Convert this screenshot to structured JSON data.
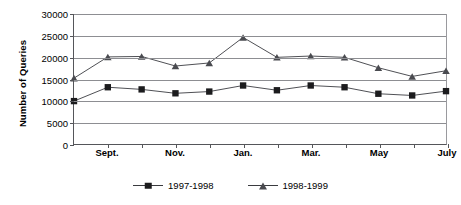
{
  "chart_data": {
    "type": "line",
    "title": "",
    "xlabel": "",
    "ylabel": "Number of Queries",
    "ylim": [
      0,
      30000
    ],
    "ytick_values": [
      0,
      5000,
      10000,
      15000,
      20000,
      25000,
      30000
    ],
    "ytick_labels": [
      "0",
      "5000",
      "10000",
      "15000",
      "20000",
      "25000",
      "30000"
    ],
    "grid": true,
    "legend_position": "bottom-center",
    "x": [
      "Aug.",
      "Sept.",
      "Oct.",
      "Nov.",
      "Dec.",
      "Jan.",
      "Feb.",
      "Mar.",
      "Apr.",
      "May",
      "June",
      "July"
    ],
    "xtick_labels_shown": [
      "Sept.",
      "Nov.",
      "Jan.",
      "Mar.",
      "May",
      "July"
    ],
    "xtick_label_indices": [
      1,
      3,
      5,
      7,
      9,
      11
    ],
    "series": [
      {
        "name": "1997-1998",
        "marker": "square",
        "color": "#1c1c1e",
        "values": [
          9900,
          13100,
          12600,
          11700,
          12100,
          13500,
          12400,
          13500,
          13100,
          11600,
          11200,
          12200
        ]
      },
      {
        "name": "1998-1999",
        "marker": "triangle",
        "color": "#4a4b50",
        "values": [
          15200,
          20100,
          20200,
          18000,
          18700,
          24600,
          20000,
          20300,
          20000,
          17600,
          15600,
          16900
        ]
      }
    ]
  },
  "legend": {
    "entries": [
      {
        "label": "1997-1998",
        "marker": "square-marker"
      },
      {
        "label": "1998-1999",
        "marker": "triangle-marker"
      }
    ]
  }
}
